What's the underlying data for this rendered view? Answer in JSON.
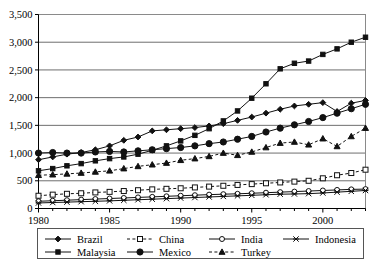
{
  "chart_data": {
    "type": "line",
    "title": "",
    "xlabel": "",
    "ylabel": "",
    "xlim": [
      1980,
      2003
    ],
    "ylim": [
      0,
      3500
    ],
    "ytick_labels": [
      "0",
      "500",
      "1,000",
      "1,500",
      "2,000",
      "2,500",
      "3,000",
      "3,500"
    ],
    "ytick_values": [
      0,
      500,
      1000,
      1500,
      2000,
      2500,
      3000,
      3500
    ],
    "xtick_labels": [
      "1980",
      "1985",
      "1990",
      "1995",
      "2000"
    ],
    "xtick_values": [
      1980,
      1985,
      1990,
      1995,
      2000
    ],
    "grid": "horizontal",
    "legend_position": "bottom",
    "x": [
      1980,
      1981,
      1982,
      1983,
      1984,
      1985,
      1986,
      1987,
      1988,
      1989,
      1990,
      1991,
      1992,
      1993,
      1994,
      1995,
      1996,
      1997,
      1998,
      1999,
      2000,
      2001,
      2002,
      2003
    ],
    "series": [
      {
        "name": "Brazil",
        "marker": "diamond-filled",
        "dash": "solid",
        "values": [
          880,
          930,
          980,
          1010,
          1060,
          1130,
          1230,
          1290,
          1400,
          1420,
          1440,
          1460,
          1490,
          1530,
          1590,
          1650,
          1720,
          1790,
          1850,
          1880,
          1910,
          1750,
          1900,
          1950
        ]
      },
      {
        "name": "China",
        "marker": "square-open",
        "dash": "dashed",
        "values": [
          230,
          250,
          265,
          275,
          290,
          300,
          315,
          330,
          345,
          355,
          365,
          380,
          395,
          410,
          425,
          440,
          455,
          470,
          485,
          500,
          545,
          600,
          640,
          700
        ]
      },
      {
        "name": "India",
        "marker": "circle-open",
        "dash": "solid",
        "values": [
          130,
          140,
          150,
          160,
          170,
          180,
          190,
          200,
          210,
          220,
          230,
          240,
          250,
          258,
          265,
          275,
          285,
          295,
          305,
          315,
          325,
          335,
          345,
          350
        ]
      },
      {
        "name": "Indonesia",
        "marker": "x-cross",
        "dash": "solid",
        "values": [
          100,
          108,
          115,
          123,
          130,
          138,
          148,
          158,
          168,
          178,
          188,
          198,
          208,
          218,
          228,
          238,
          248,
          258,
          262,
          268,
          280,
          295,
          310,
          325
        ]
      },
      {
        "name": "Malaysia",
        "marker": "square-filled",
        "dash": "solid",
        "values": [
          680,
          720,
          770,
          810,
          860,
          900,
          930,
          980,
          1050,
          1130,
          1220,
          1320,
          1440,
          1580,
          1760,
          1990,
          2250,
          2520,
          2620,
          2660,
          2780,
          2880,
          3000,
          3090
        ]
      },
      {
        "name": "Mexico",
        "marker": "circle-filled",
        "dash": "solid",
        "values": [
          1000,
          1010,
          1000,
          1000,
          1020,
          1030,
          1020,
          1040,
          1060,
          1080,
          1100,
          1130,
          1170,
          1200,
          1250,
          1300,
          1380,
          1450,
          1510,
          1570,
          1640,
          1720,
          1800,
          1880
        ]
      },
      {
        "name": "Turkey",
        "marker": "triangle-filled",
        "dash": "dashed",
        "values": [
          600,
          610,
          625,
          640,
          660,
          680,
          720,
          760,
          790,
          820,
          870,
          900,
          940,
          1000,
          960,
          1020,
          1100,
          1180,
          1200,
          1150,
          1260,
          1120,
          1300,
          1450
        ]
      }
    ]
  },
  "legend": {
    "entries": [
      {
        "label": "Brazil"
      },
      {
        "label": "China"
      },
      {
        "label": "India"
      },
      {
        "label": "Indonesia"
      },
      {
        "label": "Malaysia"
      },
      {
        "label": "Mexico"
      },
      {
        "label": "Turkey"
      }
    ]
  }
}
